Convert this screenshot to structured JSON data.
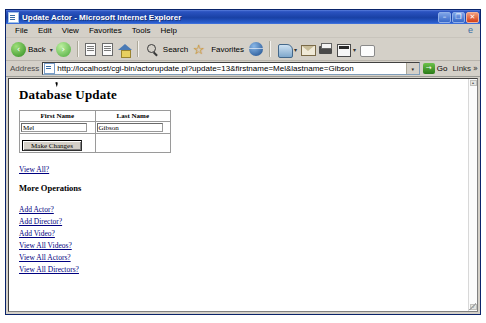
{
  "window": {
    "title": "Update Actor - Microsoft Internet Explorer",
    "app_icon": "ie-document-icon",
    "controls": {
      "minimize": "–",
      "maximize": "❐",
      "close": "✕"
    }
  },
  "menubar": {
    "items": [
      {
        "label": "File"
      },
      {
        "label": "Edit"
      },
      {
        "label": "View"
      },
      {
        "label": "Favorites"
      },
      {
        "label": "Tools"
      },
      {
        "label": "Help"
      }
    ]
  },
  "toolbar": {
    "back_label": "Back",
    "search_label": "Search",
    "favorites_label": "Favorites",
    "caret": "▾"
  },
  "addressbar": {
    "label": "Address",
    "url": "http://localhost/cgi-bin/actorupdate.pl?update=13&firstname=Mel&lastname=Gibson",
    "dropdown_glyph": "▾",
    "go_label": "Go",
    "go_glyph": "→",
    "links_label": "Links",
    "links_chevron": "»"
  },
  "page": {
    "heading": "Database Update",
    "table": {
      "headers": [
        "First Name",
        "Last Name"
      ],
      "row": {
        "first_name": "Mel",
        "last_name": "Gibson"
      },
      "submit_label": "Make Changes"
    },
    "view_all_link": "View All?",
    "more_operations_heading": "More Operations",
    "operation_links": [
      "Add Actor?",
      "Add Director?",
      "Add Video?",
      "View All Videos?",
      "View All Actors?",
      "View All Directors?"
    ]
  },
  "scrollbar": {
    "up_glyph": "▴",
    "down_glyph": "▾"
  },
  "colors": {
    "titlebar_blue": "#1941a5",
    "chrome_gray": "#d4d0c8",
    "link_blue": "#000080",
    "page_white": "#ffffff"
  }
}
